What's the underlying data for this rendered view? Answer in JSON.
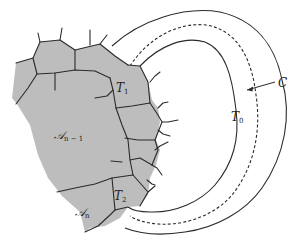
{
  "figure": {
    "colors": {
      "tile_fill": "#bdbdbd",
      "edge": "#2a2a2a",
      "background": "#ffffff"
    },
    "labels": {
      "T1": {
        "main": "T",
        "sub": "1"
      },
      "T2": {
        "main": "T",
        "sub": "2"
      },
      "T0": {
        "main": "T",
        "sub": "0"
      },
      "C": {
        "main": "C"
      },
      "A_n_minus_1": {
        "main": "𝒜",
        "sub": "n − 1"
      },
      "A_n": {
        "main": "𝒜",
        "sub": "n"
      }
    },
    "annotations": {
      "C_arrow": "arrow pointing from label C to the dashed curve"
    }
  }
}
